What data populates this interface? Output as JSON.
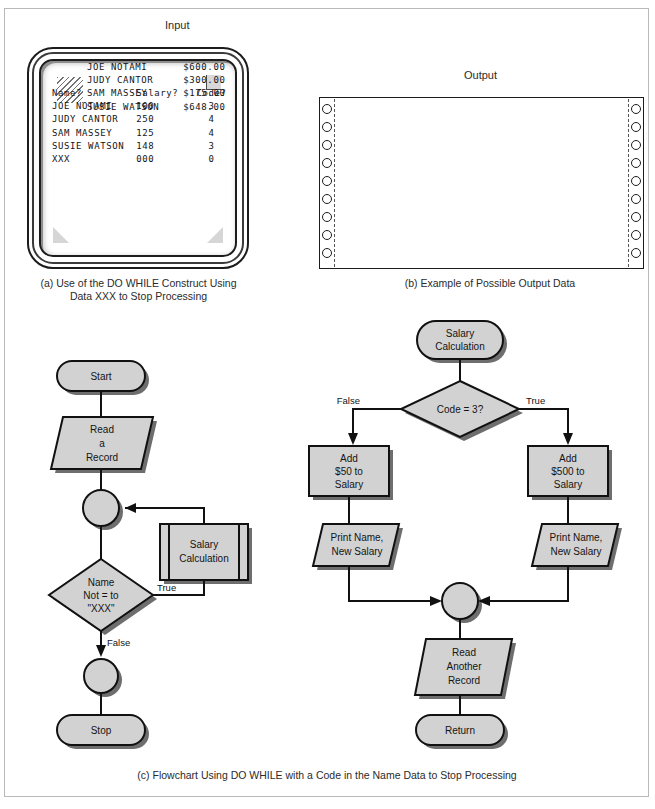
{
  "figure": {
    "input_label": "Input",
    "output_label": "Output",
    "caption_a_line1": "(a) Use of the DO WHILE Construct Using",
    "caption_a_line2": "Data XXX to Stop Processing",
    "caption_b": "(b) Example of Possible Output Data",
    "caption_c": "(c) Flowchart Using DO WHILE with a Code in the Name Data to Stop Processing"
  },
  "screen": {
    "header": {
      "name": "Name?",
      "salary": "Salary?",
      "code": "Code?"
    },
    "rows": [
      {
        "name": "JOE NOTAMI",
        "salary": "100",
        "code": "3"
      },
      {
        "name": "JUDY CANTOR",
        "salary": "250",
        "code": "4"
      },
      {
        "name": "SAM MASSEY",
        "salary": "125",
        "code": "4"
      },
      {
        "name": "SUSIE WATSON",
        "salary": "148",
        "code": "3"
      },
      {
        "name": "XXX",
        "salary": "000",
        "code": "0"
      }
    ],
    "text": "Name?         Salary?   Code?\nJOE NOTAMI    100         3\nJUDY CANTOR   250         4\nSAM MASSEY    125         4\nSUSIE WATSON  148         3\nXXX           000         0"
  },
  "printout": {
    "rows": [
      {
        "name": "JOE NOTAMI",
        "amount": "$600.00"
      },
      {
        "name": "JUDY CANTOR",
        "amount": "$300.00"
      },
      {
        "name": "SAM MASSEY",
        "amount": "$175.00"
      },
      {
        "name": "SUSIE WATSON",
        "amount": "$648.00"
      }
    ],
    "text": "JOE NOTAMI      $600.00\nJUDY CANTOR     $300.00\nSAM MASSEY      $175.00\nSUSIE WATSON    $648.00",
    "hole_count": 9
  },
  "flowchart_main": {
    "start": "Start",
    "read_record_l1": "Read",
    "read_record_l2": "a",
    "read_record_l3": "Record",
    "predefined_l1": "Salary",
    "predefined_l2": "Calculation",
    "decision_l1": "Name",
    "decision_l2": "Not = to",
    "decision_l3": "\"XXX\"",
    "label_true": "True",
    "label_false": "False",
    "stop": "Stop"
  },
  "flowchart_sub": {
    "title_l1": "Salary",
    "title_l2": "Calculation",
    "decision": "Code = 3?",
    "label_false": "False",
    "label_true": "True",
    "left_l1": "Add",
    "left_l2": "$50 to",
    "left_l3": "Salary",
    "right_l1": "Add",
    "right_l2": "$500 to",
    "right_l3": "Salary",
    "print_left_l1": "Print Name,",
    "print_left_l2": "New Salary",
    "print_right_l1": "Print Name,",
    "print_right_l2": "New Salary",
    "read_another_l1": "Read",
    "read_another_l2": "Another",
    "read_another_l3": "Record",
    "return": "Return"
  },
  "colors": {
    "shape_fill": "#d2d2d2",
    "stroke": "#111111",
    "shadow": "#6e6e6e",
    "frame_border": "#b9b9b9",
    "page_bg": "#ffffff"
  }
}
